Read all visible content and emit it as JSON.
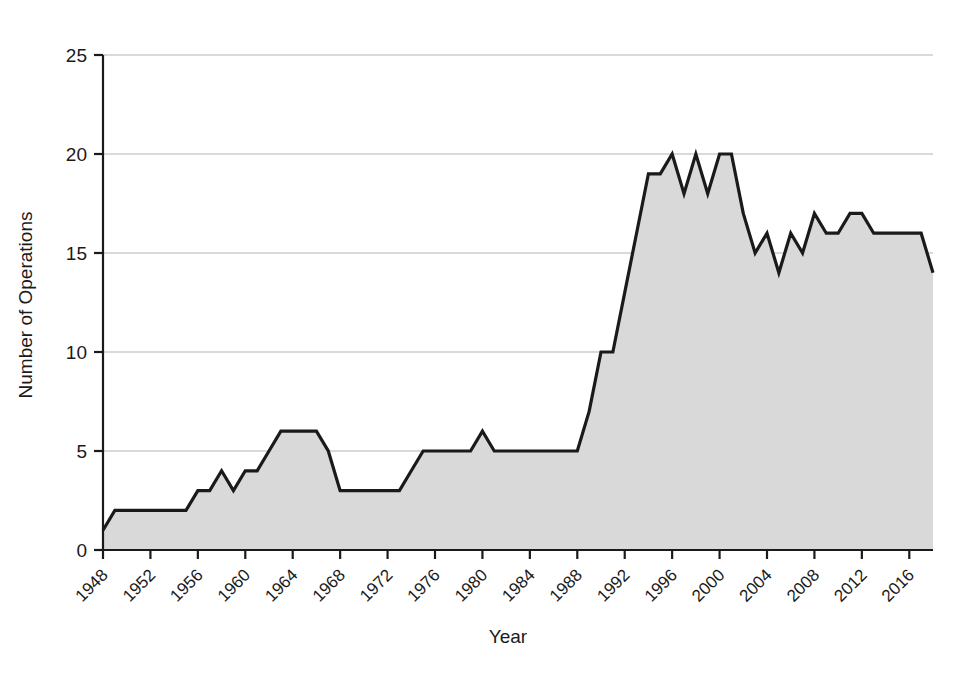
{
  "chart_data": {
    "type": "area",
    "title": "",
    "xlabel": "Year",
    "ylabel": "Number of Operations",
    "xlim": [
      1948,
      2018
    ],
    "ylim": [
      0,
      25
    ],
    "grid": true,
    "legend": "none",
    "series_name": "Number of Operations",
    "area_fill_color": "#d9d9d9",
    "line_color": "#1a1a1a",
    "axis_color": "#1a1a1a",
    "gridline_color": "#b3b3b3",
    "background_color": "#ffffff",
    "y_ticks": [
      0,
      5,
      10,
      15,
      20,
      25
    ],
    "y_tick_labels": [
      "0",
      "5",
      "10",
      "15",
      "20",
      "25"
    ],
    "x_ticks": [
      1948,
      1952,
      1956,
      1960,
      1964,
      1968,
      1972,
      1976,
      1980,
      1984,
      1988,
      1992,
      1996,
      2000,
      2004,
      2008,
      2012,
      2016
    ],
    "x_tick_labels": [
      "1948",
      "1952",
      "1956",
      "1960",
      "1964",
      "1968",
      "1972",
      "1976",
      "1980",
      "1984",
      "1988",
      "1992",
      "1996",
      "2000",
      "2004",
      "2008",
      "2012",
      "2016"
    ],
    "x_tick_label_rotation": -45,
    "x": [
      1948,
      1949,
      1950,
      1951,
      1952,
      1953,
      1954,
      1955,
      1956,
      1957,
      1958,
      1959,
      1960,
      1961,
      1962,
      1963,
      1964,
      1965,
      1966,
      1967,
      1968,
      1969,
      1970,
      1971,
      1972,
      1973,
      1974,
      1975,
      1976,
      1977,
      1978,
      1979,
      1980,
      1981,
      1982,
      1983,
      1984,
      1985,
      1986,
      1987,
      1988,
      1989,
      1990,
      1991,
      1992,
      1993,
      1994,
      1995,
      1996,
      1997,
      1998,
      1999,
      2000,
      2001,
      2002,
      2003,
      2004,
      2005,
      2006,
      2007,
      2008,
      2009,
      2010,
      2011,
      2012,
      2013,
      2014,
      2015,
      2016,
      2017,
      2018
    ],
    "values": [
      1,
      2,
      2,
      2,
      2,
      2,
      2,
      2,
      3,
      3,
      4,
      3,
      4,
      4,
      5,
      6,
      6,
      6,
      6,
      5,
      3,
      3,
      3,
      3,
      3,
      3,
      4,
      5,
      5,
      5,
      5,
      5,
      6,
      5,
      5,
      5,
      5,
      5,
      5,
      5,
      5,
      7,
      10,
      10,
      13,
      16,
      19,
      19,
      20,
      18,
      20,
      18,
      20,
      20,
      17,
      15,
      16,
      14,
      16,
      15,
      17,
      16,
      16,
      17,
      17,
      16,
      16,
      16,
      16,
      16,
      14
    ]
  }
}
